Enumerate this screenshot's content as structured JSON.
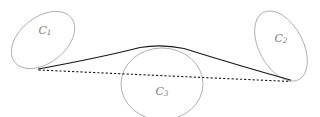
{
  "figure": {
    "background_color": "#ffffff",
    "width": 320,
    "height": 117,
    "ellipse_stroke_color": "#9a9a9a",
    "line_color": "#1a1a1a",
    "label_color": "#808080"
  },
  "regions": [
    {
      "id": "c1",
      "label_base": "C",
      "label_sub": "1",
      "label_full": "C1",
      "label_x": 45,
      "label_y": 31,
      "cx": 43,
      "cy": 40,
      "rx": 36,
      "ry": 23,
      "rotation": -38
    },
    {
      "id": "c2",
      "label_base": "C",
      "label_sub": "2",
      "label_full": "C2",
      "label_x": 281,
      "label_y": 39,
      "cx": 281,
      "cy": 46,
      "rx": 38,
      "ry": 22,
      "rotation": 62
    },
    {
      "id": "c3",
      "label_base": "C",
      "label_sub": "3",
      "label_full": "C3",
      "label_x": 162,
      "label_y": 92,
      "cx": 162,
      "cy": 84,
      "rx": 41,
      "ry": 36,
      "rotation": 0
    }
  ],
  "paths": {
    "solid_arc": {
      "name": "solid-arc",
      "style": "solid",
      "d": "M 38.5 69 Q 103 57 140 47.5 Q 162 43.8 184 48.5 Q 240 66 290.5 80",
      "start_x": 38.5,
      "start_y": 69,
      "apex_x": 162,
      "apex_y": 45,
      "end_x": 290.5,
      "end_y": 80
    },
    "dashed_chord": {
      "name": "dashed-chord",
      "style": "dashed",
      "d": "M 38.5 70 L 290.5 81.5",
      "start_x": 38.5,
      "start_y": 70,
      "end_x": 290.5,
      "end_y": 81.5
    }
  },
  "vertices": [
    {
      "id": "left-vertex",
      "x": 38.5,
      "y": 69.5
    },
    {
      "id": "right-vertex",
      "x": 290.5,
      "y": 80.5
    }
  ]
}
